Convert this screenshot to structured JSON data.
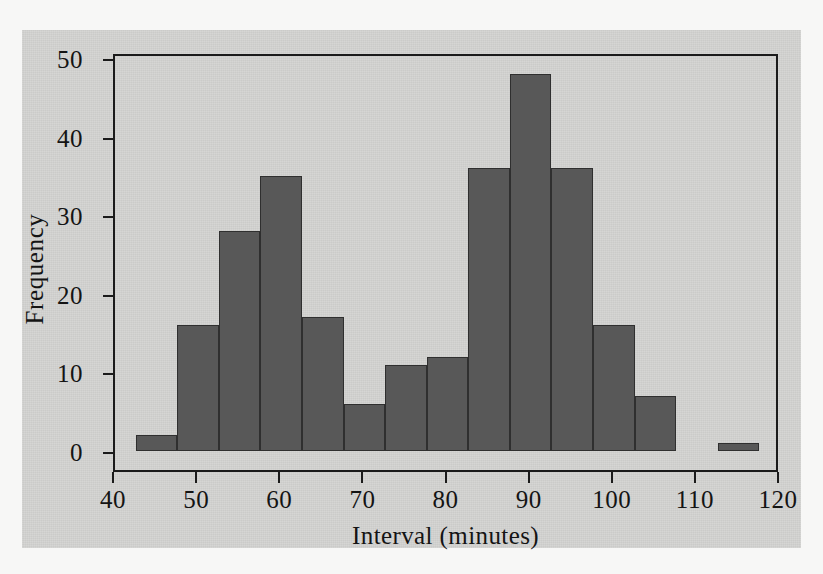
{
  "chart_data": {
    "type": "bar",
    "title": "",
    "xlabel": "Interval (minutes)",
    "ylabel": "Frequency",
    "xlim": [
      40,
      120
    ],
    "ylim": [
      0,
      51
    ],
    "grid": false,
    "legend": null,
    "bin_width": 5,
    "bin_edges": [
      42.5,
      47.5,
      52.5,
      57.5,
      62.5,
      67.5,
      72.5,
      77.5,
      82.5,
      87.5,
      92.5,
      97.5,
      102.5,
      107.5,
      112.5,
      117.5
    ],
    "categories": [
      "42.5-47.5",
      "47.5-52.5",
      "52.5-57.5",
      "57.5-62.5",
      "62.5-67.5",
      "67.5-72.5",
      "72.5-77.5",
      "77.5-82.5",
      "82.5-87.5",
      "87.5-92.5",
      "92.5-97.5",
      "97.5-102.5",
      "102.5-107.5",
      "107.5-112.5",
      "112.5-117.5"
    ],
    "values": [
      2,
      16,
      28,
      35,
      17,
      6,
      11,
      12,
      36,
      48,
      36,
      16,
      7,
      0,
      1
    ],
    "bar_color": "#585858",
    "bar_edge_color": "#2f2f2f",
    "plot_background": "#d3d3d1",
    "axis_color": "#1b1b1b",
    "xticks": [
      {
        "value": 40,
        "label": "40"
      },
      {
        "value": 50,
        "label": "50"
      },
      {
        "value": 60,
        "label": "60"
      },
      {
        "value": 70,
        "label": "70"
      },
      {
        "value": 80,
        "label": "80"
      },
      {
        "value": 90,
        "label": "90"
      },
      {
        "value": 100,
        "label": "100"
      },
      {
        "value": 110,
        "label": "110"
      },
      {
        "value": 120,
        "label": "120"
      }
    ],
    "yticks": [
      {
        "value": 0,
        "label": "0"
      },
      {
        "value": 10,
        "label": "10"
      },
      {
        "value": 20,
        "label": "20"
      },
      {
        "value": 30,
        "label": "30"
      },
      {
        "value": 40,
        "label": "40"
      },
      {
        "value": 50,
        "label": "50"
      }
    ]
  }
}
